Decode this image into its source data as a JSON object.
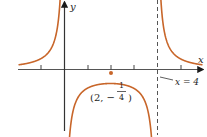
{
  "chart_data": {
    "type": "line",
    "title": "",
    "function": "f(x) = 1/(x(x-4))",
    "xlabel": "x",
    "ylabel": "y",
    "x_ticks": [
      -1,
      1,
      2,
      3,
      5
    ],
    "xlim": [
      -2.7,
      5.9
    ],
    "vertical_asymptotes": [
      0,
      4
    ],
    "horizontal_asymptote": 0,
    "annotations": [
      {
        "text": "(2, -1/4)",
        "x": 2,
        "y": -0.25,
        "type": "point"
      },
      {
        "text": "x = 4",
        "x": 4,
        "type": "asymptote-label"
      }
    ],
    "series": [
      {
        "name": "f(x)",
        "color": "#c8662a",
        "branches": [
          "x<0",
          "0<x<4",
          "x>4"
        ]
      }
    ],
    "grid": false
  },
  "labels": {
    "y_axis": "y",
    "x_axis": "x",
    "asymptote": "x = 4",
    "point_open": "(2, −",
    "point_num": "1",
    "point_den": "4",
    "point_close": ")"
  },
  "colors": {
    "curve": "#c8662a",
    "axis": "#2a2a2a",
    "asymptote": "#555555",
    "point": "#c8662a"
  }
}
